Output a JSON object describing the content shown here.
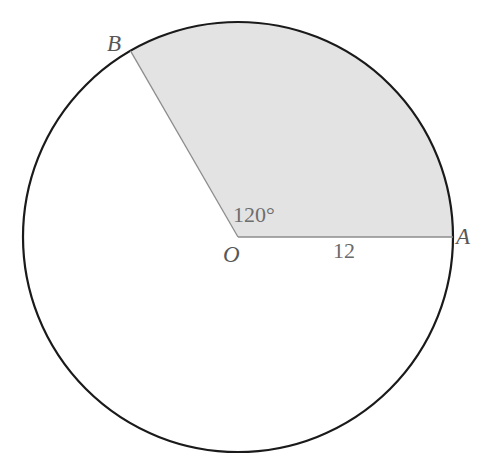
{
  "figure": {
    "background_color": "#ffffff"
  },
  "labels": {
    "center": "O",
    "point_a": "A",
    "point_b": "B",
    "radius_value": "12",
    "angle_value": "120°"
  },
  "colors": {
    "circle_outline": "#1a1a1a",
    "sector_fill": "#e3e3e3",
    "sector_radius_line": "#8d8d8d",
    "point_label": "#575757",
    "measure_label": "#6a6a6a"
  },
  "geometry": {
    "circle": {
      "center_x": 238,
      "center_y": 237,
      "radius": 215,
      "outline_width": 2.2
    },
    "sector": {
      "start_angle_deg": 0,
      "sweep_deg": 120,
      "radius_line_width": 1.3,
      "point_a_x": 453,
      "point_a_y": 237,
      "point_b_x": 130.5,
      "point_b_y": 51.8
    }
  },
  "chart_data": {
    "type": "diagram",
    "shape": "circle",
    "radius": 12,
    "central_angle_deg": 120,
    "vertices": [
      {
        "name": "O",
        "role": "center"
      },
      {
        "name": "A",
        "role": "arc-endpoint",
        "angle_deg": 0
      },
      {
        "name": "B",
        "role": "arc-endpoint",
        "angle_deg": 120
      }
    ],
    "annotations": [
      {
        "text": "12",
        "describes": "radius OA"
      },
      {
        "text": "120°",
        "describes": "central angle AOB"
      }
    ],
    "shaded_region": "sector AOB"
  }
}
